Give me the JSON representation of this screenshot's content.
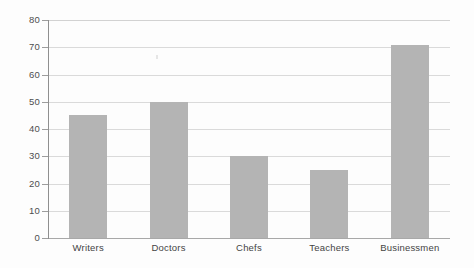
{
  "chart_data": {
    "type": "bar",
    "title": "",
    "subtitle": "",
    "xlabel": "",
    "ylabel": "",
    "categories": [
      "Writers",
      "Doctors",
      "Chefs",
      "Teachers",
      "Businessmen"
    ],
    "values": [
      45,
      50,
      30,
      25,
      71
    ],
    "ylim": [
      0,
      80
    ],
    "ytick_step": 10,
    "yticks": [
      80,
      70,
      60,
      50,
      40,
      30,
      20,
      10,
      0
    ],
    "ytick_labels": [
      "80",
      "70",
      "60",
      "50",
      "40",
      "30",
      "20",
      "10",
      "0"
    ],
    "grid": true,
    "grid_axis": "y",
    "legend": false,
    "legend_position": "none",
    "orientation": "vertical",
    "bar_color": "#b4b4b4",
    "gridline_color": "#dadada",
    "axis_color": "#8f8f8f",
    "text_color": "#4a4a4a",
    "background_color": "#fdfdfd"
  }
}
